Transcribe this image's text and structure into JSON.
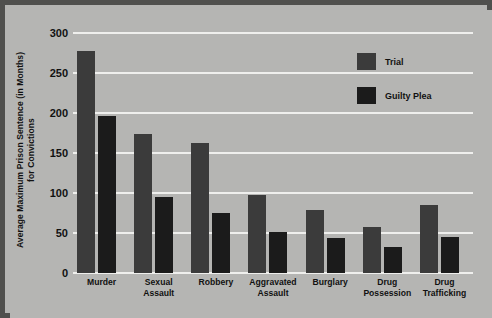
{
  "chart_data": {
    "type": "bar",
    "title": "",
    "xlabel": "",
    "ylabel": "Average Maximum Prison Sentence (in Months)\nfor Convictions",
    "ylabel_line1": "Average Maximum Prison Sentence (in Months)",
    "ylabel_line2": "for Convictions",
    "ylim": [
      0,
      300
    ],
    "ytick_values": [
      0,
      50,
      100,
      150,
      200,
      250,
      300
    ],
    "ytick_labels": [
      "0",
      "50",
      "100",
      "150",
      "200",
      "250",
      "300"
    ],
    "grid": true,
    "legend_position": "top-right",
    "categories": [
      "Murder",
      "Sexual\nAssault",
      "Robbery",
      "Aggravated\nAssault",
      "Burglary",
      "Drug\nPossession",
      "Drug\nTrafficking"
    ],
    "series": [
      {
        "name": "Trial",
        "color": "#3b3b3b",
        "values": [
          278,
          174,
          162,
          97,
          79,
          57,
          85
        ]
      },
      {
        "name": "Guilty Plea",
        "color": "#1b1b1b",
        "values": [
          196,
          95,
          75,
          51,
          44,
          33,
          45
        ]
      }
    ]
  },
  "colors": {
    "background": "#b5b5b3",
    "frame": "#4f4f4d",
    "gridline": "#efefed",
    "text": "#111111"
  }
}
